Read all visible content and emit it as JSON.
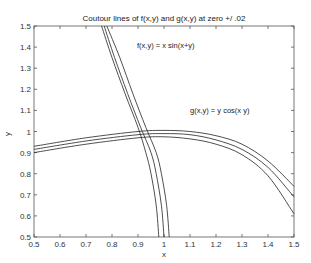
{
  "chart_data": {
    "type": "line",
    "title": "Coutour lines of f(x,y) and g(x,y) at zero +/  .02",
    "xlabel": "x",
    "ylabel": "y",
    "xlim": [
      0.5,
      1.5
    ],
    "ylim": [
      0.5,
      1.5
    ],
    "grid": false,
    "xticks": [
      "0.5",
      "0.6",
      "0.7",
      "0.8",
      "0.9",
      "1",
      "1.1",
      "1.2",
      "1.3",
      "1.4",
      "1.5"
    ],
    "yticks": [
      "0.5",
      "0.6",
      "0.7",
      "0.8",
      "0.9",
      "1",
      "1.1",
      "1.2",
      "1.3",
      "1.4",
      "1.5"
    ],
    "annotations": [
      {
        "text": "f(x,y) = x   sin(x+y)",
        "x": 0.92,
        "y": 1.4
      },
      {
        "text": "g(x,y) = y   cos(x y)",
        "x": 1.1,
        "y": 1.04
      }
    ],
    "series": [
      {
        "name": "f = -0.02",
        "x": [
          0.76,
          0.8,
          0.85,
          0.9,
          0.93,
          0.95,
          0.97,
          0.98
        ],
        "y": [
          1.5,
          1.35,
          1.18,
          1.02,
          0.9,
          0.8,
          0.65,
          0.5
        ]
      },
      {
        "name": "f = 0",
        "x": [
          0.77,
          0.81,
          0.86,
          0.91,
          0.95,
          0.97,
          0.99,
          1.0
        ],
        "y": [
          1.5,
          1.35,
          1.18,
          1.02,
          0.9,
          0.8,
          0.65,
          0.5
        ]
      },
      {
        "name": "f = +0.02",
        "x": [
          0.78,
          0.83,
          0.88,
          0.93,
          0.97,
          0.99,
          1.01,
          1.02
        ],
        "y": [
          1.5,
          1.35,
          1.18,
          1.02,
          0.9,
          0.8,
          0.65,
          0.5
        ]
      },
      {
        "name": "g = +0.02",
        "x": [
          0.5,
          0.7,
          0.9,
          1.0,
          1.1,
          1.2,
          1.3,
          1.4,
          1.5
        ],
        "y": [
          0.93,
          0.97,
          1.0,
          1.005,
          1.0,
          0.98,
          0.94,
          0.86,
          0.74
        ]
      },
      {
        "name": "g = 0",
        "x": [
          0.5,
          0.7,
          0.9,
          1.0,
          1.1,
          1.2,
          1.3,
          1.4,
          1.5
        ],
        "y": [
          0.915,
          0.955,
          0.985,
          0.99,
          0.985,
          0.96,
          0.915,
          0.83,
          0.69
        ]
      },
      {
        "name": "g = -0.02",
        "x": [
          0.5,
          0.7,
          0.9,
          1.0,
          1.1,
          1.2,
          1.3,
          1.4,
          1.5
        ],
        "y": [
          0.9,
          0.94,
          0.97,
          0.975,
          0.965,
          0.94,
          0.89,
          0.79,
          0.61
        ]
      }
    ]
  }
}
